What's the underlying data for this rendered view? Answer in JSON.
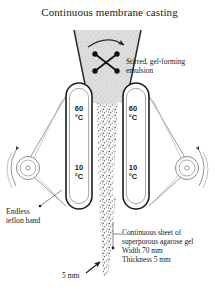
{
  "title": "Continuous membrane casting",
  "labels": {
    "stirrer_line1": "Stirred, gel-forming",
    "stirrer_line2": "emulsion",
    "teflon_line1": "Endless",
    "teflon_line2": "teflon band",
    "sheet_line1": "Continuous sheet of",
    "sheet_line2": "superporous agarose gel",
    "sheet_line3": "Width 70 mm",
    "sheet_line4": "Thickness 5 mm",
    "gap_dimension": "5 mm"
  },
  "temperatures": {
    "hot_value": "60",
    "hot_unit": "°C",
    "cold_value": "10",
    "cold_unit": "°C"
  },
  "icons": {
    "stirrer": "stirrer-paddle-icon",
    "rotation_top": "rotation-arrow-icon",
    "pulley_left": "pulley-wheel-icon",
    "pulley_right": "pulley-wheel-icon",
    "dimension_arrow": "dimension-arrow-icon"
  },
  "colors": {
    "ink": "#1a1a1a",
    "line": "#3a3a3a",
    "light_line": "#8a8a8a",
    "emulsion_fill": "#d9d9d9",
    "gel_speckle": "#777777",
    "background": "#ffffff"
  }
}
